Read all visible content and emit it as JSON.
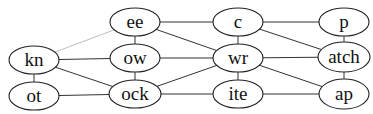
{
  "diagram": {
    "type": "graph",
    "nodes": [
      {
        "id": "kn",
        "label": "kn",
        "cx": 34,
        "cy": 60,
        "rx": 25,
        "ry": 14
      },
      {
        "id": "ot",
        "label": "ot",
        "cx": 34,
        "cy": 96,
        "rx": 25,
        "ry": 14
      },
      {
        "id": "ee",
        "label": "ee",
        "cx": 135,
        "cy": 22,
        "rx": 25,
        "ry": 14
      },
      {
        "id": "ow",
        "label": "ow",
        "cx": 135,
        "cy": 58,
        "rx": 25,
        "ry": 14
      },
      {
        "id": "ock",
        "label": "ock",
        "cx": 135,
        "cy": 94,
        "rx": 26,
        "ry": 14
      },
      {
        "id": "c",
        "label": "c",
        "cx": 238,
        "cy": 22,
        "rx": 25,
        "ry": 14
      },
      {
        "id": "wr",
        "label": "wr",
        "cx": 238,
        "cy": 58,
        "rx": 25,
        "ry": 14
      },
      {
        "id": "ite",
        "label": "ite",
        "cx": 238,
        "cy": 94,
        "rx": 25,
        "ry": 14
      },
      {
        "id": "p",
        "label": "p",
        "cx": 344,
        "cy": 22,
        "rx": 25,
        "ry": 14
      },
      {
        "id": "atch",
        "label": "atch",
        "cx": 344,
        "cy": 57,
        "rx": 26,
        "ry": 15
      },
      {
        "id": "ap",
        "label": "ap",
        "cx": 344,
        "cy": 94,
        "rx": 25,
        "ry": 15
      }
    ],
    "edges": [
      {
        "from": "kn",
        "to": "ee",
        "style": "light"
      },
      {
        "from": "kn",
        "to": "ow",
        "style": "normal"
      },
      {
        "from": "kn",
        "to": "ock",
        "style": "normal"
      },
      {
        "from": "kn",
        "to": "ot",
        "style": "normal"
      },
      {
        "from": "ot",
        "to": "ock",
        "style": "normal"
      },
      {
        "from": "ee",
        "to": "ow",
        "style": "normal"
      },
      {
        "from": "ow",
        "to": "ock",
        "style": "normal"
      },
      {
        "from": "ee",
        "to": "c",
        "style": "normal"
      },
      {
        "from": "ee",
        "to": "wr",
        "style": "normal"
      },
      {
        "from": "ow",
        "to": "wr",
        "style": "normal"
      },
      {
        "from": "ock",
        "to": "wr",
        "style": "normal"
      },
      {
        "from": "ock",
        "to": "ite",
        "style": "normal"
      },
      {
        "from": "c",
        "to": "wr",
        "style": "normal"
      },
      {
        "from": "wr",
        "to": "ite",
        "style": "normal"
      },
      {
        "from": "c",
        "to": "p",
        "style": "normal"
      },
      {
        "from": "c",
        "to": "atch",
        "style": "normal"
      },
      {
        "from": "wr",
        "to": "atch",
        "style": "normal"
      },
      {
        "from": "wr",
        "to": "ap",
        "style": "normal"
      },
      {
        "from": "ite",
        "to": "ap",
        "style": "normal"
      },
      {
        "from": "p",
        "to": "atch",
        "style": "normal"
      },
      {
        "from": "atch",
        "to": "ap",
        "style": "normal"
      }
    ]
  }
}
